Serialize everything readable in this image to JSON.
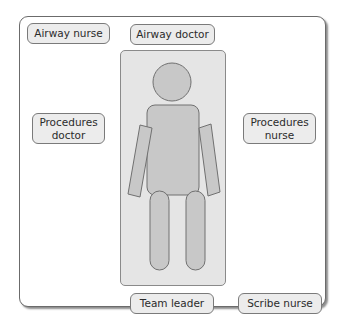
{
  "diagram": {
    "title": "",
    "roles": {
      "airway_nurse": "Airway nurse",
      "airway_doctor": "Airway doctor",
      "procedures_doctor_line1": "Procedures",
      "procedures_doctor_line2": "doctor",
      "procedures_nurse_line1": "Procedures",
      "procedures_nurse_line2": "nurse",
      "team_leader": "Team leader",
      "scribe_nurse": "Scribe nurse"
    },
    "center": {
      "object": "patient-on-trolley",
      "body_parts": [
        "head",
        "torso",
        "left-arm",
        "right-arm",
        "left-leg",
        "right-leg"
      ]
    },
    "colors": {
      "role_fill": "#ececec",
      "role_border": "#7a7a7a",
      "trolley_fill": "#e5e5e5",
      "body_fill": "#c8c8c8",
      "body_stroke": "#707070",
      "frame_border": "#6b6b6b"
    }
  }
}
